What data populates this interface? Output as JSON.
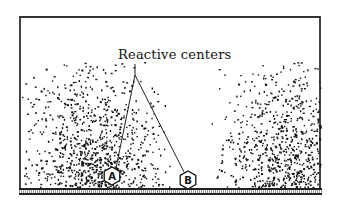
{
  "figure": {
    "title_label": "Reactive centers",
    "centers": [
      {
        "id": "A",
        "x": 112,
        "y": 176
      },
      {
        "id": "B",
        "x": 188,
        "y": 180
      }
    ],
    "leader": {
      "stem_top": [
        135,
        64
      ],
      "apex": [
        135,
        75
      ]
    },
    "clusters": [
      {
        "name": "left-particle-cloud",
        "cx": 95,
        "cy": 188,
        "sx": 34,
        "sy": 36,
        "n": 900,
        "xmin": 22,
        "xmax": 170,
        "seed": 7
      },
      {
        "name": "right-particle-cloud",
        "cx": 290,
        "cy": 188,
        "sx": 34,
        "sy": 38,
        "n": 850,
        "xmin": 210,
        "xmax": 320,
        "seed": 13
      }
    ],
    "colors": {
      "ink": "#111111",
      "background": "#ffffff",
      "frame": "#444444"
    }
  }
}
